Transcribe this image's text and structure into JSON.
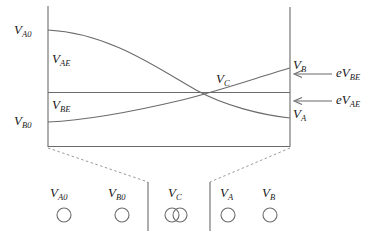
{
  "figure": {
    "stroke_color": "#6b6b6b",
    "text_color": "#1a1a1a",
    "axis": {
      "left_x": 48,
      "right_x": 290,
      "top_y": 6,
      "bottom_y": 147
    },
    "labels": {
      "v_a0": "V",
      "v_a0_sub": "A0",
      "v_ae": "V",
      "v_ae_sub": "AE",
      "v_be": "V",
      "v_be_sub": "BE",
      "v_b0": "V",
      "v_b0_sub": "B0",
      "v_c": "V",
      "v_c_sub": "C",
      "v_b": "V",
      "v_b_sub": "B",
      "v_a": "V",
      "v_a_sub": "A",
      "ev_be": "eV",
      "ev_be_sub": "BE",
      "ev_ae": "eV",
      "ev_ae_sub": "AE"
    },
    "electrodes": [
      {
        "name": "V",
        "sub": "A0",
        "x": 64,
        "circle_type": "single"
      },
      {
        "name": "V",
        "sub": "B0",
        "x": 122,
        "circle_type": "single"
      },
      {
        "name": "V",
        "sub": "C",
        "x": 176,
        "circle_type": "double"
      },
      {
        "name": "V",
        "sub": "A",
        "x": 228,
        "circle_type": "single"
      },
      {
        "name": "V",
        "sub": "B",
        "x": 270,
        "circle_type": "single"
      }
    ],
    "brackets": [
      {
        "x": 148,
        "y_top": 182,
        "y_bottom": 231
      },
      {
        "x": 210,
        "y_top": 182,
        "y_bottom": 231
      }
    ],
    "curves": {
      "v_a_curve_start_y": 30,
      "v_a_curve_end_y": 118,
      "v_b_curve_start_y": 122,
      "v_b_curve_end_y": 68,
      "mid_line_y": 92,
      "crossing_x": 228,
      "crossing_y": 93
    },
    "arrows": [
      {
        "label": "eV",
        "sub": "BE",
        "y": 74,
        "x_tip": 294,
        "x_tail": 330
      },
      {
        "label": "eV",
        "sub": "AE",
        "y": 101,
        "x_tip": 294,
        "x_tail": 330
      }
    ]
  }
}
